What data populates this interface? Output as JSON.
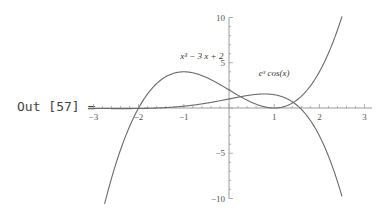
{
  "cell": {
    "output_label": "Out [57] ="
  },
  "chart_data": {
    "type": "line",
    "title": "",
    "xlabel": "",
    "ylabel": "",
    "xlim": [
      -3,
      3
    ],
    "ylim": [
      -10,
      10
    ],
    "grid": false,
    "legend": "none (inline curve labels)",
    "x_ticks": [
      -3,
      -2,
      -1,
      1,
      2,
      3
    ],
    "y_ticks": [
      10,
      5,
      -5,
      -10
    ],
    "series": [
      {
        "name": "x^3 - 3x + 2",
        "label_html": "x³ − 3 x + 2",
        "expression": "x^3 - 3*x + 2",
        "domain": [
          -3,
          2.5
        ],
        "label_pos": [
          -0.6,
          5.4
        ],
        "samples": [
          {
            "x": -2.7,
            "y": -9.58
          },
          {
            "x": -2,
            "y": 0
          },
          {
            "x": -1,
            "y": 4
          },
          {
            "x": 0,
            "y": 2
          },
          {
            "x": 1,
            "y": 0
          },
          {
            "x": 2,
            "y": 4
          },
          {
            "x": 2.5,
            "y": 10.125
          }
        ]
      },
      {
        "name": "e^x cos(x)",
        "label_html": "eˣ cos(x)",
        "expression": "exp(x)*cos(x)",
        "domain": [
          -3,
          2.5
        ],
        "label_pos": [
          1.0,
          3.5
        ],
        "samples": [
          {
            "x": -3,
            "y": -0.05
          },
          {
            "x": -2,
            "y": -0.06
          },
          {
            "x": -1,
            "y": 0.2
          },
          {
            "x": 0,
            "y": 1
          },
          {
            "x": 0.79,
            "y": 1.55
          },
          {
            "x": 1,
            "y": 1.47
          },
          {
            "x": 1.57,
            "y": 0
          },
          {
            "x": 2,
            "y": -3.07
          },
          {
            "x": 2.5,
            "y": -9.76
          }
        ]
      }
    ],
    "colors": {
      "curve": "#6a6a6a",
      "axis": "#9a9a9a"
    }
  }
}
